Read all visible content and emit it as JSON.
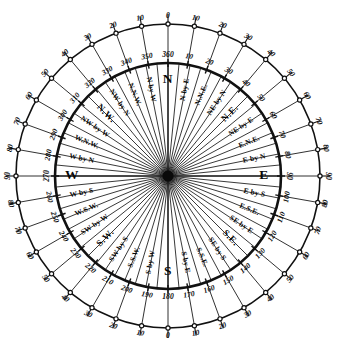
{
  "diagram": {
    "type": "compass-rose",
    "center": {
      "x": 168,
      "y": 176
    },
    "rings": {
      "inner_radius": 113,
      "outer_radius": 152,
      "inner_label_radius": 121,
      "outer_label_radius": 160,
      "point_label_radius": 88,
      "cardinal_label_radius": 96,
      "tick_outer_extent": 10
    },
    "colors": {
      "ink": "#0a0a0a",
      "line": "#151515",
      "paper": "#ffffff"
    },
    "points": [
      {
        "name": "N",
        "label": "N",
        "azimuth": 0,
        "kind": "cardinal"
      },
      {
        "name": "N by E",
        "label": "N by E",
        "azimuth": 11.25,
        "kind": "by"
      },
      {
        "name": "NNE",
        "label": "N.N.E.",
        "azimuth": 22.5,
        "kind": "minor"
      },
      {
        "name": "NE by N",
        "label": "NE by N",
        "azimuth": 33.75,
        "kind": "by"
      },
      {
        "name": "NE",
        "label": "N.E.",
        "azimuth": 45,
        "kind": "major"
      },
      {
        "name": "NE by E",
        "label": "NE by E",
        "azimuth": 56.25,
        "kind": "by"
      },
      {
        "name": "ENE",
        "label": "E.N.E.",
        "azimuth": 67.5,
        "kind": "minor"
      },
      {
        "name": "E by N",
        "label": "E by N",
        "azimuth": 78.75,
        "kind": "by"
      },
      {
        "name": "E",
        "label": "E",
        "azimuth": 90,
        "kind": "cardinal"
      },
      {
        "name": "E by S",
        "label": "E by S",
        "azimuth": 101.25,
        "kind": "by"
      },
      {
        "name": "ESE",
        "label": "E.S.E.",
        "azimuth": 112.5,
        "kind": "minor"
      },
      {
        "name": "SE by E",
        "label": "SE by E",
        "azimuth": 123.75,
        "kind": "by"
      },
      {
        "name": "SE",
        "label": "S.E.",
        "azimuth": 135,
        "kind": "major"
      },
      {
        "name": "SE by S",
        "label": "SE by S",
        "azimuth": 146.25,
        "kind": "by"
      },
      {
        "name": "SSE",
        "label": "S.S.E.",
        "azimuth": 157.5,
        "kind": "minor"
      },
      {
        "name": "S by E",
        "label": "S by E",
        "azimuth": 168.75,
        "kind": "by"
      },
      {
        "name": "S",
        "label": "S",
        "azimuth": 180,
        "kind": "cardinal"
      },
      {
        "name": "S by W",
        "label": "S by W",
        "azimuth": 191.25,
        "kind": "by"
      },
      {
        "name": "SSW",
        "label": "S.S.W.",
        "azimuth": 202.5,
        "kind": "minor"
      },
      {
        "name": "SW by S",
        "label": "SW by S",
        "azimuth": 213.75,
        "kind": "by"
      },
      {
        "name": "SW",
        "label": "S.W.",
        "azimuth": 225,
        "kind": "major"
      },
      {
        "name": "SW by W",
        "label": "SW by W",
        "azimuth": 236.25,
        "kind": "by"
      },
      {
        "name": "WSW",
        "label": "W.S.W.",
        "azimuth": 247.5,
        "kind": "minor"
      },
      {
        "name": "W by S",
        "label": "W by S",
        "azimuth": 258.75,
        "kind": "by"
      },
      {
        "name": "W",
        "label": "W",
        "azimuth": 270,
        "kind": "cardinal"
      },
      {
        "name": "W by N",
        "label": "W by N",
        "azimuth": 281.25,
        "kind": "by"
      },
      {
        "name": "WNW",
        "label": "W.N.W.",
        "azimuth": 292.5,
        "kind": "minor"
      },
      {
        "name": "NW by W",
        "label": "NW by W",
        "azimuth": 303.75,
        "kind": "by"
      },
      {
        "name": "NW",
        "label": "N.W.",
        "azimuth": 315,
        "kind": "major"
      },
      {
        "name": "NW by N",
        "label": "NW by N",
        "azimuth": 326.25,
        "kind": "by"
      },
      {
        "name": "NNW",
        "label": "N.N.W.",
        "azimuth": 337.5,
        "kind": "minor"
      },
      {
        "name": "N by W",
        "label": "N by W",
        "azimuth": 348.75,
        "kind": "by"
      }
    ],
    "inner_scale": {
      "description": "360-degree azimuth scale on the inner circle, labelled every 10 degrees",
      "step": 10,
      "labels": [
        {
          "value": "360",
          "azimuth": 0
        },
        {
          "value": "10",
          "azimuth": 10
        },
        {
          "value": "20",
          "azimuth": 20
        },
        {
          "value": "30",
          "azimuth": 30
        },
        {
          "value": "40",
          "azimuth": 40
        },
        {
          "value": "50",
          "azimuth": 50
        },
        {
          "value": "60",
          "azimuth": 60
        },
        {
          "value": "70",
          "azimuth": 70
        },
        {
          "value": "80",
          "azimuth": 80
        },
        {
          "value": "90",
          "azimuth": 90
        },
        {
          "value": "100",
          "azimuth": 100
        },
        {
          "value": "110",
          "azimuth": 110
        },
        {
          "value": "120",
          "azimuth": 120
        },
        {
          "value": "130",
          "azimuth": 130
        },
        {
          "value": "140",
          "azimuth": 140
        },
        {
          "value": "150",
          "azimuth": 150
        },
        {
          "value": "160",
          "azimuth": 160
        },
        {
          "value": "170",
          "azimuth": 170
        },
        {
          "value": "180",
          "azimuth": 180
        },
        {
          "value": "190",
          "azimuth": 190
        },
        {
          "value": "200",
          "azimuth": 200
        },
        {
          "value": "210",
          "azimuth": 210
        },
        {
          "value": "220",
          "azimuth": 220
        },
        {
          "value": "230",
          "azimuth": 230
        },
        {
          "value": "240",
          "azimuth": 240
        },
        {
          "value": "250",
          "azimuth": 250
        },
        {
          "value": "260",
          "azimuth": 260
        },
        {
          "value": "270",
          "azimuth": 270
        },
        {
          "value": "280",
          "azimuth": 280
        },
        {
          "value": "290",
          "azimuth": 290
        },
        {
          "value": "300",
          "azimuth": 300
        },
        {
          "value": "310",
          "azimuth": 310
        },
        {
          "value": "320",
          "azimuth": 320
        },
        {
          "value": "330",
          "azimuth": 330
        },
        {
          "value": "340",
          "azimuth": 340
        },
        {
          "value": "350",
          "azimuth": 350
        }
      ]
    },
    "outer_scale": {
      "description": "Quadrantal scale on the outer circle reading 0 to 90 from North and South toward East and West",
      "step": 10,
      "labels": [
        {
          "value": "0",
          "azimuth": 0
        },
        {
          "value": "10",
          "azimuth": 10
        },
        {
          "value": "20",
          "azimuth": 20
        },
        {
          "value": "30",
          "azimuth": 30
        },
        {
          "value": "40",
          "azimuth": 40
        },
        {
          "value": "50",
          "azimuth": 50
        },
        {
          "value": "60",
          "azimuth": 60
        },
        {
          "value": "70",
          "azimuth": 70
        },
        {
          "value": "80",
          "azimuth": 80
        },
        {
          "value": "90",
          "azimuth": 90
        },
        {
          "value": "80",
          "azimuth": 100
        },
        {
          "value": "70",
          "azimuth": 110
        },
        {
          "value": "60",
          "azimuth": 120
        },
        {
          "value": "50",
          "azimuth": 130
        },
        {
          "value": "40",
          "azimuth": 140
        },
        {
          "value": "30",
          "azimuth": 150
        },
        {
          "value": "20",
          "azimuth": 160
        },
        {
          "value": "10",
          "azimuth": 170
        },
        {
          "value": "0",
          "azimuth": 180
        },
        {
          "value": "10",
          "azimuth": 190
        },
        {
          "value": "20",
          "azimuth": 200
        },
        {
          "value": "30",
          "azimuth": 210
        },
        {
          "value": "40",
          "azimuth": 220
        },
        {
          "value": "50",
          "azimuth": 230
        },
        {
          "value": "60",
          "azimuth": 240
        },
        {
          "value": "70",
          "azimuth": 250
        },
        {
          "value": "80",
          "azimuth": 260
        },
        {
          "value": "90",
          "azimuth": 270
        },
        {
          "value": "80",
          "azimuth": 280
        },
        {
          "value": "70",
          "azimuth": 290
        },
        {
          "value": "60",
          "azimuth": 300
        },
        {
          "value": "50",
          "azimuth": 310
        },
        {
          "value": "40",
          "azimuth": 320
        },
        {
          "value": "30",
          "azimuth": 330
        },
        {
          "value": "20",
          "azimuth": 340
        },
        {
          "value": "10",
          "azimuth": 350
        }
      ]
    }
  }
}
